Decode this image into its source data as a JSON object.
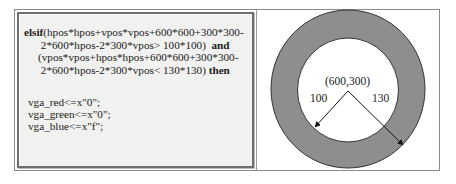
{
  "code": {
    "line1_kw": "elsif",
    "line1_rest": "(hpos*hpos+vpos*vpos+600*600+300*300-",
    "line2_rest": "2*600*hpos-2*300*vpos> 100*100)  ",
    "line2_kw": "and",
    "line3_rest": "(vpos*vpos+hpos*hpos+600*600+300*300-",
    "line4_rest": "2*600*hpos-2*300*vpos< 130*130) ",
    "line4_kw": "then",
    "assign1": "vga_red<=x\"0\";",
    "assign2": "vga_green<=x\"0\";",
    "assign3": "vga_blue<=x\"f\";"
  },
  "diagram": {
    "center_label": "(600,300)",
    "inner_radius_label": "100",
    "outer_radius_label": "130",
    "ring_color": "#8e8e8e"
  }
}
